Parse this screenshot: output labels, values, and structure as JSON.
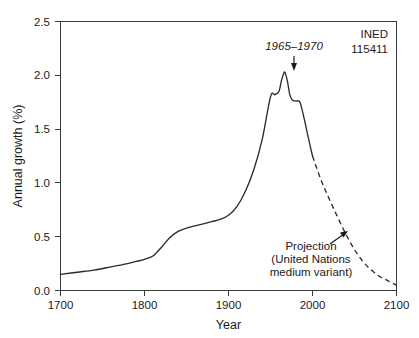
{
  "chart_data": {
    "type": "line",
    "title": "",
    "xlabel": "Year",
    "ylabel": "Annual growth (%)",
    "xlim": [
      1700,
      2100
    ],
    "ylim": [
      0.0,
      2.5
    ],
    "xticks": [
      1700,
      1800,
      1900,
      2000,
      2100
    ],
    "xtick_labels": [
      "1700",
      "1800",
      "1900",
      "2000",
      "2100"
    ],
    "yticks": [
      0.0,
      0.5,
      1.0,
      1.5,
      2.0,
      2.5
    ],
    "ytick_labels": [
      "0.0",
      "0.5",
      "1.0",
      "1.5",
      "2.0",
      "2.5"
    ],
    "grid": false,
    "legend": "none",
    "series": [
      {
        "name": "Observed annual growth",
        "style": "solid",
        "x": [
          1700,
          1720,
          1740,
          1760,
          1780,
          1790,
          1800,
          1810,
          1820,
          1830,
          1840,
          1850,
          1860,
          1870,
          1880,
          1890,
          1900,
          1910,
          1920,
          1930,
          1940,
          1950,
          1955,
          1960,
          1963,
          1965,
          1967,
          1970,
          1973,
          1976,
          1980,
          1985,
          1990,
          1995,
          2000
        ],
        "y": [
          0.15,
          0.17,
          0.19,
          0.22,
          0.25,
          0.27,
          0.29,
          0.32,
          0.4,
          0.49,
          0.55,
          0.58,
          0.6,
          0.62,
          0.64,
          0.66,
          0.7,
          0.78,
          0.92,
          1.12,
          1.4,
          1.8,
          1.82,
          1.85,
          1.95,
          2.0,
          2.03,
          1.95,
          1.82,
          1.77,
          1.76,
          1.75,
          1.6,
          1.42,
          1.25
        ]
      },
      {
        "name": "Projection (United Nations medium variant)",
        "style": "dashed",
        "x": [
          2000,
          2010,
          2020,
          2030,
          2040,
          2050,
          2060,
          2070,
          2080,
          2090,
          2100
        ],
        "y": [
          1.25,
          1.03,
          0.85,
          0.68,
          0.52,
          0.38,
          0.27,
          0.19,
          0.13,
          0.09,
          0.05
        ]
      }
    ],
    "annotations": [
      {
        "id": "peak-annotation",
        "label": "1965–1970",
        "style": "italic",
        "arrow": "down",
        "points_to_x": 1967,
        "points_to_y": 2.03
      },
      {
        "id": "projection-annotation",
        "label_lines": [
          "Projection",
          "(United Nations",
          "medium variant)"
        ],
        "style": "normal",
        "arrow": "up-right",
        "points_to_x": 2036,
        "points_to_y": 0.45
      }
    ],
    "credit": {
      "organization": "INED",
      "reference": "115411"
    },
    "colors": {
      "line": "#2b2b2b",
      "axis": "#3a3a3a",
      "text": "#1a1a1a",
      "background": "#ffffff"
    }
  }
}
